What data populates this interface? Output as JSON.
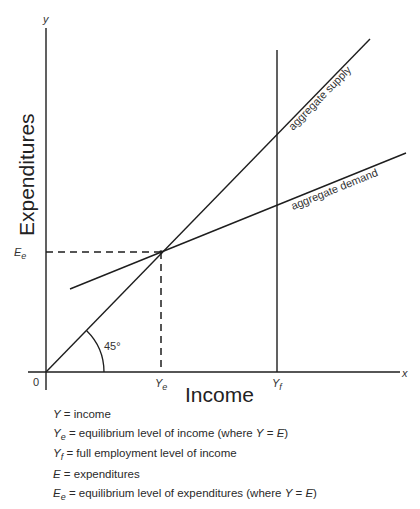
{
  "diagram": {
    "y_axis_letter": "y",
    "x_axis_letter": "x",
    "origin_label": "0",
    "y_axis_title": "Expenditures",
    "x_axis_title": "Income",
    "angle_label": "45°",
    "ee_label": {
      "base": "E",
      "sub": "e"
    },
    "ye_label": {
      "base": "Y",
      "sub": "e"
    },
    "yf_label": {
      "base": "Y",
      "sub": "f"
    },
    "curves": {
      "supply": "aggregate supply",
      "demand": "aggregate demand"
    }
  },
  "legend": [
    {
      "sym": "Y",
      "sub": "",
      "text": " = income"
    },
    {
      "sym": "Y",
      "sub": "e",
      "text": " = equilibrium level of income (where ",
      "tail_sym1": "Y",
      "tail_mid": " = ",
      "tail_sym2": "E",
      "tail_end": ")"
    },
    {
      "sym": "Y",
      "sub": "f",
      "text": " = full employment level of income"
    },
    {
      "sym": "E",
      "sub": "",
      "text": " = expenditures"
    },
    {
      "sym": "E",
      "sub": "e",
      "text": " = equilibrium level of expenditures (where ",
      "tail_sym1": "Y",
      "tail_mid": " = ",
      "tail_sym2": "E",
      "tail_end": ")"
    }
  ]
}
